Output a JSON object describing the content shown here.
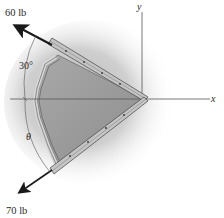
{
  "diagram": {
    "type": "statics-force-diagram",
    "forces": [
      {
        "label": "60 lb",
        "magnitude": 60,
        "unit": "lb",
        "direction": "upper-left",
        "angle_from_vertical_deg": 30
      },
      {
        "label": "70 lb",
        "magnitude": 70,
        "unit": "lb",
        "direction": "lower-left",
        "angle_symbol": "θ"
      }
    ],
    "axes": {
      "x_label": "x",
      "y_label": "y"
    },
    "angle_labels": {
      "upper": "30°",
      "lower": "θ"
    },
    "colors": {
      "arrow": "#1a1a1a",
      "axis": "#555555",
      "plate_fill": "#9a9a9a",
      "bar_fill": "#b8b8b8",
      "shadow": "#c8c8c8",
      "text": "#2a2a2a"
    }
  }
}
